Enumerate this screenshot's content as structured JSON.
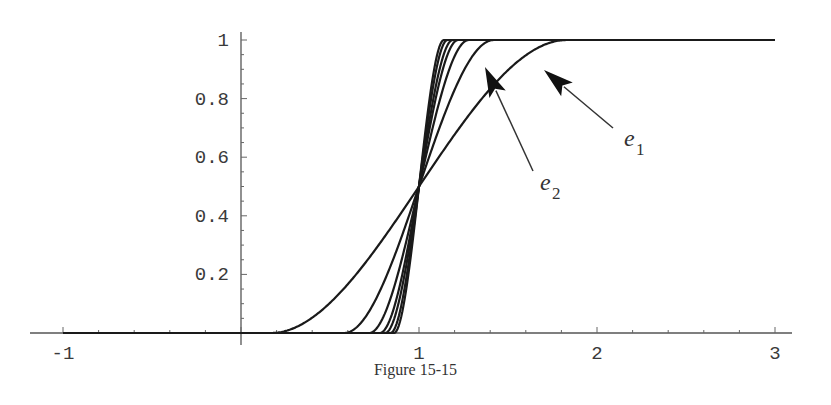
{
  "caption": "Figure 15-15",
  "chart_data": {
    "type": "line",
    "title": "",
    "xlabel": "",
    "ylabel": "",
    "xlim": [
      -1,
      3.1
    ],
    "ylim": [
      0,
      1
    ],
    "x_ticks": [
      -1,
      1,
      2,
      3
    ],
    "x_tick_labels": [
      "-1",
      "1",
      "2",
      "3"
    ],
    "y_ticks": [
      0.2,
      0.4,
      0.6,
      0.8,
      1
    ],
    "y_tick_labels": [
      "0.2",
      "0.4",
      "0.6",
      "0.8",
      "1"
    ],
    "grid": false,
    "legend": null,
    "series": [
      {
        "name": "e1",
        "center": 1,
        "start": 0.17,
        "end": 1.83
      },
      {
        "name": "e2",
        "center": 1,
        "start": 0.58,
        "end": 1.42
      },
      {
        "name": "e3",
        "center": 1,
        "start": 0.72,
        "end": 1.28
      },
      {
        "name": "e4",
        "center": 1,
        "start": 0.78,
        "end": 1.22
      },
      {
        "name": "e5",
        "center": 1,
        "start": 0.81,
        "end": 1.19
      },
      {
        "name": "e6",
        "center": 1,
        "start": 0.84,
        "end": 1.16
      },
      {
        "name": "e7",
        "center": 1,
        "start": 0.86,
        "end": 1.14
      }
    ],
    "annotations": [
      {
        "label": "e",
        "subscript": "1",
        "points_to": "widest curve",
        "tip_px": [
          544,
          70
        ],
        "tail_px": [
          613,
          128
        ],
        "label_px": [
          624,
          146
        ]
      },
      {
        "label": "e",
        "subscript": "2",
        "points_to": "second curve",
        "tip_px": [
          485,
          67
        ],
        "tail_px": [
          533,
          171
        ],
        "label_px": [
          540,
          190
        ]
      }
    ]
  },
  "plot_px": {
    "x0": 241,
    "x_per_unit": 178,
    "y0": 333,
    "y_per_unit": 293,
    "axis_x_left": 30,
    "axis_x_right": 792,
    "axis_y_top": 32
  }
}
